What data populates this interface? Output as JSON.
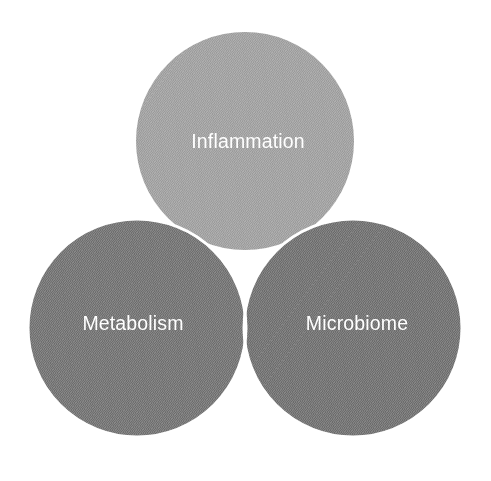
{
  "figure": {
    "type": "venn-3",
    "background_color": "#ffffff",
    "stroke_color": "#ffffff",
    "stroke_width": 3,
    "label_color": "#ffffff"
  },
  "chart_data": {
    "type": "venn",
    "title": "",
    "subtitle": "",
    "xlabel": "",
    "ylabel": "",
    "grid": false,
    "legend": "none",
    "sets": [
      {
        "id": "inflammation",
        "label": "Inflammation",
        "fill": "#a5a5a5",
        "cx": 245,
        "cy": 141,
        "r": 109,
        "label_x": 248,
        "label_y": 143
      },
      {
        "id": "metabolism",
        "label": "Metabolism",
        "fill": "#7a7a7a",
        "cx": 137,
        "cy": 328,
        "r": 109,
        "label_x": 133,
        "label_y": 325
      },
      {
        "id": "microbiome",
        "label": "Microbiome",
        "fill": "#787878",
        "cx": 353,
        "cy": 328,
        "r": 109,
        "label_x": 357,
        "label_y": 325
      }
    ],
    "intersections": [
      {
        "id": "inflammation-metabolism",
        "sets": [
          "inflammation",
          "metabolism"
        ],
        "fill": "#6f6f6f",
        "label": ""
      },
      {
        "id": "inflammation-microbiome",
        "sets": [
          "inflammation",
          "microbiome"
        ],
        "fill": "#6d6d6d",
        "label": ""
      },
      {
        "id": "metabolism-microbiome",
        "sets": [
          "metabolism",
          "microbiome"
        ],
        "fill": "#6b6b6b",
        "label": ""
      },
      {
        "id": "inflammation-metabolism-microbiome",
        "sets": [
          "inflammation",
          "metabolism",
          "microbiome"
        ],
        "fill": "#6a6a6a",
        "label": ""
      }
    ]
  }
}
